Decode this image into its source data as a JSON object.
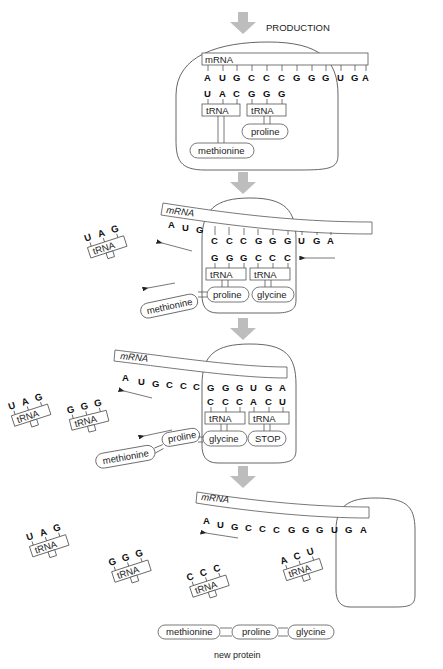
{
  "title": "PRODUCTION",
  "mrna_label": "mRNA",
  "trna_label": "tRNA",
  "codons": [
    "A",
    "U",
    "G",
    "C",
    "C",
    "C",
    "G",
    "G",
    "G",
    "U",
    "G",
    "A"
  ],
  "stages": [
    {
      "id": 1,
      "anticodons": [
        {
          "bases": [
            "U",
            "A",
            "C"
          ],
          "amino_acid": "methionine"
        },
        {
          "bases": [
            "G",
            "G",
            "G"
          ],
          "amino_acid": "proline"
        }
      ]
    },
    {
      "id": 2,
      "released_trna": {
        "bases": [
          "U",
          "A",
          "G"
        ]
      },
      "anticodons": [
        {
          "bases": [
            "G",
            "G",
            "G"
          ],
          "amino_acid": "proline"
        },
        {
          "bases": [
            "C",
            "C",
            "C"
          ],
          "amino_acid": "glycine"
        }
      ],
      "chain": [
        "methionine"
      ]
    },
    {
      "id": 3,
      "released_trna": [
        {
          "bases": [
            "U",
            "A",
            "G"
          ]
        },
        {
          "bases": [
            "G",
            "G",
            "G"
          ]
        }
      ],
      "anticodons": [
        {
          "bases": [
            "C",
            "C",
            "C"
          ],
          "amino_acid": "glycine"
        },
        {
          "bases": [
            "A",
            "C",
            "U"
          ],
          "amino_acid": "STOP"
        }
      ],
      "chain": [
        "methionine",
        "proline"
      ]
    },
    {
      "id": 4,
      "released_trna": [
        {
          "bases": [
            "U",
            "A",
            "G"
          ]
        },
        {
          "bases": [
            "G",
            "G",
            "G"
          ]
        },
        {
          "bases": [
            "C",
            "C",
            "C"
          ]
        },
        {
          "bases": [
            "A",
            "C",
            "U"
          ]
        }
      ]
    }
  ],
  "protein": {
    "chain": [
      "methionine",
      "proline",
      "glycine"
    ],
    "caption": "new protein"
  }
}
